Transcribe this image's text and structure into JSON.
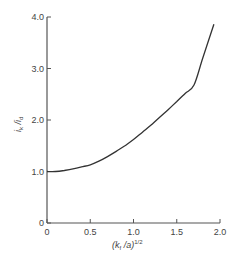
{
  "chart_data": {
    "type": "line",
    "title": "",
    "xlabel": "(k_f /a)^1/2",
    "ylabel": "i_k / i_d",
    "xlim": [
      0,
      2.0
    ],
    "ylim": [
      0,
      4.0
    ],
    "grid": false,
    "legend": null,
    "x_ticks": [
      "0",
      "0.5",
      "1.0",
      "1.5",
      "2.0"
    ],
    "y_ticks": [
      "0",
      "1.0",
      "2.0",
      "3.0",
      "4.0"
    ],
    "series": [
      {
        "name": "i_k/i_d",
        "x": [
          0,
          0.1,
          0.2,
          0.3,
          0.4,
          0.5,
          0.6,
          0.7,
          0.8,
          0.9,
          1.0,
          1.1,
          1.2,
          1.3,
          1.4,
          1.5,
          1.6,
          1.7,
          1.8,
          1.93
        ],
        "y": [
          1.0,
          1.0,
          1.02,
          1.05,
          1.09,
          1.13,
          1.2,
          1.29,
          1.39,
          1.5,
          1.62,
          1.76,
          1.9,
          2.05,
          2.2,
          2.36,
          2.52,
          2.68,
          3.2,
          3.86
        ]
      }
    ]
  },
  "labels": {
    "x_axis_main": "(k",
    "x_axis_sub": "f",
    "x_axis_rest": " /a)",
    "x_axis_sup": "1/2",
    "y_axis_i1": "i",
    "y_axis_sub1": "k",
    "y_axis_slash": " /i",
    "y_axis_sub2": "d"
  }
}
